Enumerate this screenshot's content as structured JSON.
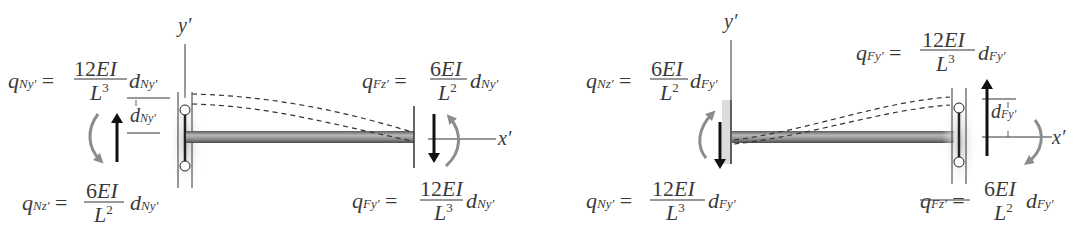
{
  "figure": {
    "colors": {
      "ink": "#3a3a3a",
      "arrow_black": "#111111",
      "arrow_gray": "#8c8c8c",
      "beam_fill": "#9a9a9a",
      "wall_shade": "#d4d4d4"
    },
    "left_diagram": {
      "axis_y_label": "y′",
      "axis_x_label": "x′",
      "displacement_label": "d",
      "displacement_sub": "Ny′",
      "eq_qNy": {
        "lhs": "q",
        "lhs_sub": "Ny′",
        "num": "12EI",
        "den": "L",
        "den_exp": "3",
        "rhs": "d",
        "rhs_sub": "Ny′"
      },
      "eq_qNz": {
        "lhs": "q",
        "lhs_sub": "Nz′",
        "num": "6EI",
        "den": "L",
        "den_exp": "2",
        "rhs": "d",
        "rhs_sub": "Ny′"
      },
      "eq_qFz": {
        "lhs": "q",
        "lhs_sub": "Fz′",
        "num": "6EI",
        "den": "L",
        "den_exp": "2",
        "rhs": "d",
        "rhs_sub": "Ny′"
      },
      "eq_qFy": {
        "lhs": "q",
        "lhs_sub": "Fy′",
        "num": "12EI",
        "den": "L",
        "den_exp": "3",
        "rhs": "d",
        "rhs_sub": "Ny′"
      }
    },
    "right_diagram": {
      "axis_y_label": "y′",
      "axis_x_label": "x′",
      "displacement_label": "d",
      "displacement_sub": "Fy′",
      "eq_qNz": {
        "lhs": "q",
        "lhs_sub": "Nz′",
        "num": "6EI",
        "den": "L",
        "den_exp": "2",
        "rhs": "d",
        "rhs_sub": "Fy′"
      },
      "eq_qNy": {
        "lhs": "q",
        "lhs_sub": "Ny′",
        "num": "12EI",
        "den": "L",
        "den_exp": "3",
        "rhs": "d",
        "rhs_sub": "Fy′"
      },
      "eq_qFy": {
        "lhs": "q",
        "lhs_sub": "Fy′",
        "num": "12EI",
        "den": "L",
        "den_exp": "3",
        "rhs": "d",
        "rhs_sub": "Fy′"
      },
      "eq_qFz": {
        "lhs": "q",
        "lhs_sub": "Fz′",
        "num": "6EI",
        "den": "L",
        "den_exp": "2",
        "rhs": "d",
        "rhs_sub": "Fy′"
      }
    },
    "equals_sign": "="
  }
}
